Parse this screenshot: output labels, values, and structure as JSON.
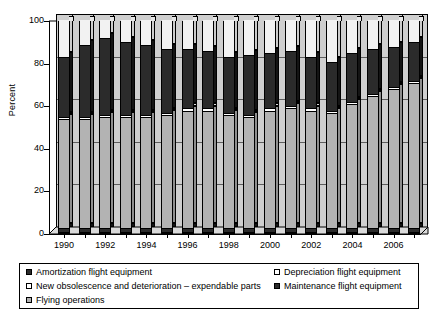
{
  "chart_data": {
    "type": "bar",
    "subtype": "stacked-percent-3d",
    "title": "",
    "xlabel": "",
    "ylabel": "Percent",
    "ylim": [
      0,
      100
    ],
    "yticks": [
      0,
      20,
      40,
      60,
      80,
      100
    ],
    "grid": true,
    "legend_position": "bottom",
    "categories": [
      "1990",
      "1991",
      "1992",
      "1993",
      "1994",
      "1995",
      "1996",
      "1997",
      "1998",
      "1999",
      "2000",
      "2001",
      "2002",
      "2003",
      "2004",
      "2005",
      "2006",
      "2007"
    ],
    "xtick_labels": [
      "1990",
      "1992",
      "1994",
      "1996",
      "1998",
      "2000",
      "2002",
      "2004",
      "2006"
    ],
    "stack_order_bottom_to_top": [
      "Amortization flight equipment",
      "Flying operations",
      "New obsolescence and deterioration – expendable parts",
      "Maintenance flight equipment",
      "Depreciation flight equipment"
    ],
    "series": [
      {
        "name": "Amortization flight equipment",
        "color": "#2b2b2b",
        "values": [
          2,
          2,
          2,
          2,
          2,
          2,
          2,
          2,
          2,
          2,
          2,
          2,
          2,
          2,
          2,
          2,
          2,
          2
        ]
      },
      {
        "name": "Flying operations",
        "color": "#b3b3b3",
        "values": [
          51,
          51,
          52,
          52,
          52,
          53,
          55,
          55,
          53,
          52,
          55,
          56,
          55,
          54,
          58,
          62,
          65,
          68
        ]
      },
      {
        "name": "New obsolescence and deterioration – expendable parts",
        "color": "#ffffff",
        "values": [
          1,
          1,
          1,
          1,
          1,
          1,
          1,
          1,
          1,
          1,
          1,
          1,
          1,
          1,
          1,
          1,
          1,
          1
        ]
      },
      {
        "name": "Maintenance flight equipment",
        "color": "#2b2b2b",
        "values": [
          28,
          34,
          36,
          34,
          33,
          30,
          28,
          27,
          26,
          28,
          26,
          26,
          24,
          23,
          23,
          21,
          19,
          18
        ]
      },
      {
        "name": "Depreciation flight equipment",
        "color": "#f2f2f2",
        "values": [
          18,
          12,
          9,
          11,
          12,
          14,
          14,
          15,
          18,
          17,
          16,
          15,
          18,
          20,
          16,
          14,
          13,
          11
        ]
      }
    ],
    "stack_tops": {
      "note": "cumulative upper boundary of each segment, percent",
      "amortization": [
        2,
        2,
        2,
        2,
        2,
        2,
        2,
        2,
        2,
        2,
        2,
        2,
        2,
        2,
        2,
        2,
        2,
        2
      ],
      "flying_operations": [
        53,
        53,
        54,
        54,
        54,
        55,
        57,
        57,
        55,
        54,
        57,
        58,
        57,
        56,
        60,
        64,
        67,
        70
      ],
      "new_obsolescence": [
        54,
        54,
        55,
        55,
        55,
        56,
        58,
        58,
        56,
        55,
        58,
        59,
        58,
        57,
        61,
        65,
        68,
        71
      ],
      "maintenance": [
        82,
        88,
        91,
        89,
        88,
        86,
        86,
        85,
        82,
        83,
        84,
        85,
        82,
        80,
        84,
        86,
        87,
        89
      ],
      "depreciation": [
        100,
        100,
        100,
        100,
        100,
        100,
        100,
        100,
        100,
        100,
        100,
        100,
        100,
        100,
        100,
        100,
        100,
        100
      ]
    }
  },
  "axis": {
    "y_title": "Percent",
    "y_tick_labels": [
      "0",
      "20",
      "40",
      "60",
      "80",
      "100"
    ],
    "x_tick_labels": [
      "1990",
      "1992",
      "1994",
      "1996",
      "1998",
      "2000",
      "2002",
      "2004",
      "2006"
    ]
  },
  "legend": {
    "entries": [
      {
        "label": "Amortization flight equipment",
        "marker": "filled-dark-square-icon",
        "color": "#2b2b2b"
      },
      {
        "label": "Depreciation flight equipment",
        "marker": "open-white-square-icon",
        "color": "#ffffff"
      },
      {
        "label": "New obsolescence and deterioration – expendable parts",
        "marker": "open-white-square-icon",
        "color": "#ffffff"
      },
      {
        "label": "Maintenance flight equipment",
        "marker": "filled-dark-square-icon",
        "color": "#2b2b2b"
      },
      {
        "label": "Flying operations",
        "marker": "light-gray-square-icon",
        "color": "#b3b3b3"
      }
    ]
  },
  "colors": {
    "plot_background": "#cfcfcf",
    "bar_flying_operations": "#b3b3b3",
    "bar_maintenance": "#2b2b2b",
    "bar_depreciation": "#f2f2f2",
    "bar_amortization": "#2b2b2b",
    "bar_obsolescence": "#ffffff",
    "outline": "#000000"
  }
}
